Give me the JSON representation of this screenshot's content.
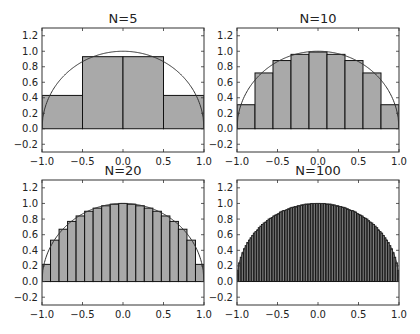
{
  "figure": {
    "width": 420,
    "height": 334,
    "background": "#ffffff"
  },
  "style": {
    "bar_fill": "#a9a9a9",
    "bar_edge": "#111111",
    "curve": "#333333",
    "frame": "#333333"
  },
  "chart_data": [
    {
      "type": "bar",
      "title": "N=5",
      "xlabel": "",
      "ylabel": "",
      "xlim": [
        -1.0,
        1.0
      ],
      "ylim": [
        -0.3,
        1.3
      ],
      "xticks": [
        -1.0,
        -0.5,
        0.0,
        0.5,
        1.0
      ],
      "xtick_labels": [
        "−1.0",
        "−0.5",
        "0.0",
        "0.5",
        "1.0"
      ],
      "yticks": [
        -0.2,
        0.0,
        0.2,
        0.4,
        0.6,
        0.8,
        1.0,
        1.2
      ],
      "ytick_labels": [
        "−0.2",
        "0.0",
        "0.2",
        "0.4",
        "0.6",
        "0.8",
        "1.0",
        "1.2"
      ],
      "grid": false,
      "legend": null,
      "bar_edges": [
        -1.0,
        -0.5,
        0.0,
        0.5,
        1.0
      ],
      "values": [
        0.43,
        0.93,
        0.93,
        0.43
      ],
      "overlay": "semicircle y = sqrt(1 - x^2)"
    },
    {
      "type": "bar",
      "title": "N=10",
      "xlabel": "",
      "ylabel": "",
      "xlim": [
        -1.0,
        1.0
      ],
      "ylim": [
        -0.3,
        1.3
      ],
      "xticks": [
        -1.0,
        -0.5,
        0.0,
        0.5,
        1.0
      ],
      "xtick_labels": [
        "−1.0",
        "−0.5",
        "0.0",
        "0.5",
        "1.0"
      ],
      "yticks": [
        -0.2,
        0.0,
        0.2,
        0.4,
        0.6,
        0.8,
        1.0,
        1.2
      ],
      "ytick_labels": [
        "−0.2",
        "0.0",
        "0.2",
        "0.4",
        "0.6",
        "0.8",
        "1.0",
        "1.2"
      ],
      "grid": false,
      "legend": null,
      "bar_count": 9,
      "values": [
        0.31,
        0.72,
        0.88,
        0.96,
        0.99,
        0.96,
        0.88,
        0.72,
        0.31
      ],
      "overlay": "semicircle y = sqrt(1 - x^2)"
    },
    {
      "type": "bar",
      "title": "N=20",
      "xlabel": "",
      "ylabel": "",
      "xlim": [
        -1.0,
        1.0
      ],
      "ylim": [
        -0.3,
        1.3
      ],
      "xticks": [
        -1.0,
        -0.5,
        0.0,
        0.5,
        1.0
      ],
      "xtick_labels": [
        "−1.0",
        "−0.5",
        "0.0",
        "0.5",
        "1.0"
      ],
      "yticks": [
        -0.2,
        0.0,
        0.2,
        0.4,
        0.6,
        0.8,
        1.0,
        1.2
      ],
      "ytick_labels": [
        "−0.2",
        "0.0",
        "0.2",
        "0.4",
        "0.6",
        "0.8",
        "1.0",
        "1.2"
      ],
      "grid": false,
      "legend": null,
      "bar_count": 19,
      "values": [
        0.22,
        0.53,
        0.67,
        0.77,
        0.84,
        0.9,
        0.94,
        0.97,
        0.99,
        1.0,
        0.99,
        0.97,
        0.94,
        0.9,
        0.84,
        0.77,
        0.67,
        0.53,
        0.22
      ],
      "overlay": "semicircle y = sqrt(1 - x^2)"
    },
    {
      "type": "bar",
      "title": "N=100",
      "xlabel": "",
      "ylabel": "",
      "xlim": [
        -1.0,
        1.0
      ],
      "ylim": [
        -0.3,
        1.3
      ],
      "xticks": [
        -1.0,
        -0.5,
        0.0,
        0.5,
        1.0
      ],
      "xtick_labels": [
        "−1.0",
        "−0.5",
        "0.0",
        "0.5",
        "1.0"
      ],
      "yticks": [
        -0.2,
        0.0,
        0.2,
        0.4,
        0.6,
        0.8,
        1.0,
        1.2
      ],
      "ytick_labels": [
        "−0.2",
        "0.0",
        "0.2",
        "0.4",
        "0.6",
        "0.8",
        "1.0",
        "1.2"
      ],
      "grid": false,
      "legend": null,
      "bar_count": 99,
      "values": [
        0.14,
        0.24,
        0.31,
        0.37,
        0.42,
        0.46,
        0.5,
        0.53,
        0.56,
        0.59,
        0.62,
        0.64,
        0.66,
        0.69,
        0.71,
        0.73,
        0.75,
        0.76,
        0.78,
        0.8,
        0.81,
        0.82,
        0.84,
        0.85,
        0.86,
        0.87,
        0.89,
        0.9,
        0.91,
        0.91,
        0.92,
        0.93,
        0.94,
        0.95,
        0.95,
        0.96,
        0.96,
        0.97,
        0.97,
        0.98,
        0.98,
        0.99,
        0.99,
        0.99,
        0.99,
        1.0,
        1.0,
        1.0,
        1.0,
        1.0,
        1.0,
        1.0,
        1.0,
        1.0,
        0.99,
        0.99,
        0.99,
        0.99,
        0.98,
        0.98,
        0.97,
        0.97,
        0.96,
        0.96,
        0.95,
        0.95,
        0.94,
        0.93,
        0.92,
        0.91,
        0.91,
        0.9,
        0.89,
        0.87,
        0.86,
        0.85,
        0.84,
        0.82,
        0.81,
        0.8,
        0.78,
        0.76,
        0.75,
        0.73,
        0.71,
        0.69,
        0.66,
        0.64,
        0.62,
        0.59,
        0.56,
        0.53,
        0.5,
        0.46,
        0.42,
        0.37,
        0.31,
        0.24,
        0.14
      ],
      "overlay": "semicircle y = sqrt(1 - x^2)"
    }
  ],
  "layout": {
    "panels": [
      {
        "left": 42,
        "top": 28,
        "right": 204,
        "bottom": 152
      },
      {
        "left": 237,
        "top": 28,
        "right": 399,
        "bottom": 152
      },
      {
        "left": 42,
        "top": 180,
        "right": 204,
        "bottom": 305
      },
      {
        "left": 237,
        "top": 180,
        "right": 399,
        "bottom": 305
      }
    ]
  }
}
